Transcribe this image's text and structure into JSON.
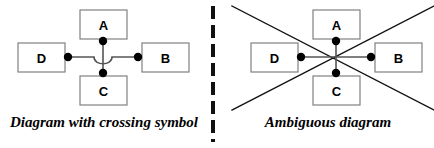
{
  "figure": {
    "background_color": "#ffffff",
    "line_color": "#555555",
    "stroke_color": "#111111",
    "box_border_color": "#808080",
    "dot_color": "#000000",
    "divider_color": "#111111"
  },
  "panels": [
    {
      "id": "crossing-symbol",
      "caption": "Diagram with crossing symbol",
      "center": {
        "x": 103,
        "y": 57
      },
      "crossing_style": "hop",
      "nodes": [
        {
          "id": "A",
          "label": "A",
          "position": "top",
          "box": {
            "x": 80,
            "y": 10,
            "w": 47,
            "h": 29
          },
          "dot": {
            "x": 103,
            "y": 41
          }
        },
        {
          "id": "B",
          "label": "B",
          "position": "right",
          "box": {
            "x": 142,
            "y": 43,
            "w": 47,
            "h": 29
          },
          "dot": {
            "x": 138,
            "y": 57
          }
        },
        {
          "id": "C",
          "label": "C",
          "position": "bottom",
          "box": {
            "x": 80,
            "y": 76,
            "w": 47,
            "h": 29
          },
          "dot": {
            "x": 103,
            "y": 73
          }
        },
        {
          "id": "D",
          "label": "D",
          "position": "left",
          "box": {
            "x": 18,
            "y": 43,
            "w": 47,
            "h": 29
          },
          "dot": {
            "x": 68,
            "y": 57
          }
        }
      ],
      "edges": [
        {
          "from": "A",
          "to": "C",
          "orientation": "vertical"
        },
        {
          "from": "D",
          "to": "B",
          "orientation": "horizontal"
        }
      ],
      "diagonals": []
    },
    {
      "id": "ambiguous",
      "caption": "Ambiguous diagram",
      "center": {
        "x": 114,
        "y": 57
      },
      "crossing_style": "none",
      "nodes": [
        {
          "id": "A",
          "label": "A",
          "position": "top",
          "box": {
            "x": 91,
            "y": 10,
            "w": 47,
            "h": 29
          },
          "dot": {
            "x": 114,
            "y": 41
          }
        },
        {
          "id": "B",
          "label": "B",
          "position": "right",
          "box": {
            "x": 153,
            "y": 43,
            "w": 47,
            "h": 29
          },
          "dot": {
            "x": 149,
            "y": 57
          }
        },
        {
          "id": "C",
          "label": "C",
          "position": "bottom",
          "box": {
            "x": 91,
            "y": 76,
            "w": 47,
            "h": 29
          },
          "dot": {
            "x": 114,
            "y": 73
          }
        },
        {
          "id": "D",
          "label": "D",
          "position": "left",
          "box": {
            "x": 29,
            "y": 43,
            "w": 47,
            "h": 29
          },
          "dot": {
            "x": 79,
            "y": 57
          }
        }
      ],
      "edges": [
        {
          "from": "A",
          "to": "C",
          "orientation": "vertical"
        },
        {
          "from": "D",
          "to": "B",
          "orientation": "horizontal"
        }
      ],
      "diagonals": [
        {
          "x1": 10,
          "y1": 6,
          "x2": 212,
          "y2": 110
        },
        {
          "x1": 212,
          "y1": 6,
          "x2": 10,
          "y2": 110
        }
      ]
    }
  ],
  "divider": {
    "style": "dashed-vertical",
    "dash_length": 13,
    "gap_length": 6,
    "thickness": 4
  }
}
